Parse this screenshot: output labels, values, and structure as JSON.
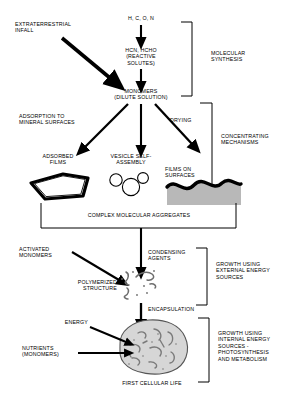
{
  "diagram": {
    "colors": {
      "ink": "#000000",
      "background": "#ffffff",
      "cell_fill": "#d6d6d6",
      "film_fill": "#b8b8b8",
      "strand": "#6e6e6e"
    },
    "nodes": {
      "source_elements": "H, C, O, N",
      "extraterrestrial_infall": "EXTRATERRESTRIAL\nINFALL",
      "reactive_solutes": "HCN, HCHO\n(REACTIVE\nSOLUTES)",
      "monomers_dilute": "MONOMERS\n(DILUTE SOLUTION)",
      "adsorption_label": "ADSORPTION TO\nMINERAL SURFACES",
      "drying_label": "DRYING",
      "adsorbed_films": "ADSORBED\nFILMS",
      "vesicle_self_assembly": "VESICLE SELF-\nASSEMBLY",
      "films_on_surfaces": "FILMS ON\nSURFACES",
      "complex_aggregates": "COMPLEX MOLECULAR AGGREGATES",
      "activated_monomers": "ACTIVATED\nMONOMERS",
      "condensing_agents": "CONDENSING\nAGENTS",
      "polymerized_structure": "POLYMERIZED\nSTRUCTURE",
      "encapsulation": "ENCAPSULATION",
      "energy": "ENERGY",
      "nutrients_monomers": "NUTRIENTS\n(MONOMERS)",
      "first_cellular_life": "FIRST CELLULAR LIFE"
    },
    "brackets": {
      "molecular_synthesis": "MOLECULAR\nSYNTHESIS",
      "concentrating_mechanisms": "CONCENTRATING\nMECHANISMS",
      "growth_external": "GROWTH USING\nEXTERNAL ENERGY\nSOURCES",
      "growth_internal": "GROWTH USING\nINTERNAL ENERGY\nSOURCES -\nPHOTOSYNTHESIS\nAND METABOLISM"
    }
  }
}
